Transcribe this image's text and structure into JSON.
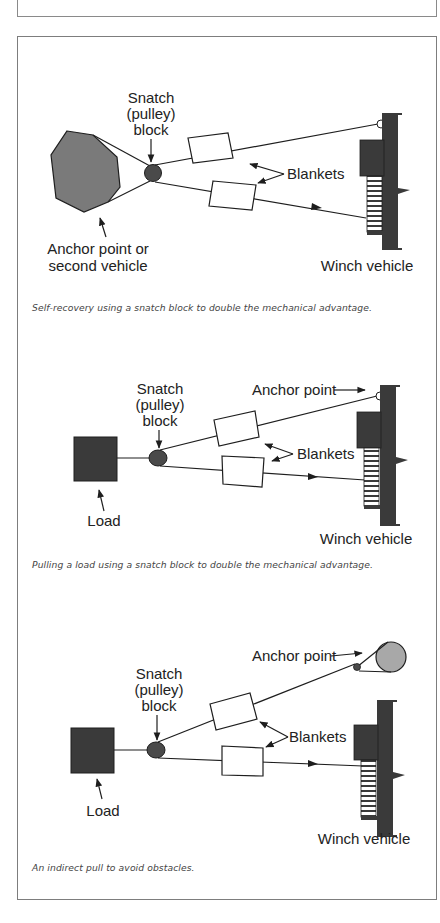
{
  "figures": [
    {
      "labels": {
        "snatch_line1": "Snatch",
        "snatch_line2": "(pulley)",
        "snatch_line3": "block",
        "blankets": "Blankets",
        "anchor_line1": "Anchor point or",
        "anchor_line2": "second vehicle",
        "winch": "Winch vehicle"
      },
      "caption": "Self-recovery using a snatch block to double the mechanical advantage."
    },
    {
      "labels": {
        "snatch_line1": "Snatch",
        "snatch_line2": "(pulley)",
        "snatch_line3": "block",
        "anchor": "Anchor point",
        "blankets": "Blankets",
        "load": "Load",
        "winch": "Winch vehicle"
      },
      "caption": "Pulling a load using a snatch block to double the mechanical advantage."
    },
    {
      "labels": {
        "snatch_line1": "Snatch",
        "snatch_line2": "(pulley)",
        "snatch_line3": "block",
        "anchor": "Anchor point",
        "blankets": "Blankets",
        "load": "Load",
        "winch": "Winch vehicle"
      },
      "caption": "An indirect pull to avoid obstacles."
    }
  ],
  "colors": {
    "anchor_fill": "#7a7a7a",
    "dark_fill": "#3a3a3a",
    "tree_fill": "#a8a8a8",
    "stroke": "#1e1e1e",
    "border": "#7d7d7d"
  }
}
